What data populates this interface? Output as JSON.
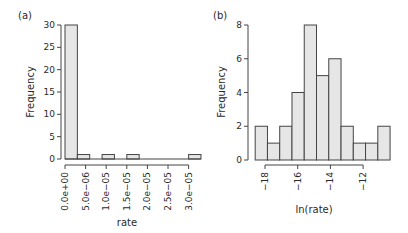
{
  "chart_data": [
    {
      "panel": "(a)",
      "type": "bar",
      "subtype": "histogram",
      "title": "",
      "xlabel": "rate",
      "ylabel": "Frequency",
      "xlim": [
        0,
        3.3e-05
      ],
      "ylim": [
        0,
        30
      ],
      "x_ticks": [
        "0.0e+00",
        "5.0e-06",
        "1.0e-05",
        "1.5e-05",
        "2.0e-05",
        "2.5e-05",
        "3.0e-05"
      ],
      "x_tick_values": [
        0,
        5e-06,
        1e-05,
        1.5e-05,
        2e-05,
        2.5e-05,
        3e-05
      ],
      "y_ticks": [
        0,
        5,
        10,
        15,
        20,
        25,
        30
      ],
      "bin_width": 3e-06,
      "bins": [
        {
          "start": 0,
          "end": 3e-06,
          "count": 30
        },
        {
          "start": 3e-06,
          "end": 6e-06,
          "count": 1
        },
        {
          "start": 6e-06,
          "end": 9e-06,
          "count": 0
        },
        {
          "start": 9e-06,
          "end": 1.2e-05,
          "count": 1
        },
        {
          "start": 1.2e-05,
          "end": 1.5e-05,
          "count": 0
        },
        {
          "start": 1.5e-05,
          "end": 1.8e-05,
          "count": 1
        },
        {
          "start": 1.8e-05,
          "end": 2.1e-05,
          "count": 0
        },
        {
          "start": 2.1e-05,
          "end": 2.4e-05,
          "count": 0
        },
        {
          "start": 2.4e-05,
          "end": 2.7e-05,
          "count": 0
        },
        {
          "start": 2.7e-05,
          "end": 3e-05,
          "count": 0
        },
        {
          "start": 3e-05,
          "end": 3.3e-05,
          "count": 1
        }
      ],
      "grid": false,
      "legend": null
    },
    {
      "panel": "(b)",
      "type": "bar",
      "subtype": "histogram",
      "title": "",
      "xlabel": "ln(rate)",
      "ylabel": "Frequency",
      "xlim": [
        -18.6,
        -10.4
      ],
      "ylim": [
        0,
        8
      ],
      "x_ticks": [
        "-18",
        "-16",
        "-14",
        "-12"
      ],
      "x_tick_values": [
        -18,
        -16,
        -14,
        -12
      ],
      "y_ticks": [
        0,
        2,
        4,
        6,
        8
      ],
      "bin_width": 0.75,
      "bins": [
        {
          "start": -18.6,
          "end": -17.85,
          "count": 2
        },
        {
          "start": -17.85,
          "end": -17.1,
          "count": 1
        },
        {
          "start": -17.1,
          "end": -16.35,
          "count": 2
        },
        {
          "start": -16.35,
          "end": -15.6,
          "count": 4
        },
        {
          "start": -15.6,
          "end": -14.85,
          "count": 8
        },
        {
          "start": -14.85,
          "end": -14.1,
          "count": 5
        },
        {
          "start": -14.1,
          "end": -13.35,
          "count": 6
        },
        {
          "start": -13.35,
          "end": -12.6,
          "count": 2
        },
        {
          "start": -12.6,
          "end": -11.85,
          "count": 1
        },
        {
          "start": -11.85,
          "end": -11.1,
          "count": 1
        },
        {
          "start": -11.1,
          "end": -10.35,
          "count": 2
        }
      ],
      "grid": false,
      "legend": null
    }
  ],
  "labels": {
    "panel_a": "(a)",
    "panel_b": "(b)",
    "a_xlabel": "rate",
    "a_ylabel": "Frequency",
    "b_xlabel": "ln(rate)",
    "b_ylabel": "Frequency"
  }
}
